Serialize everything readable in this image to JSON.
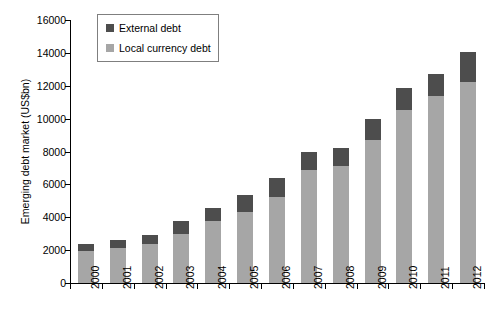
{
  "chart_data": {
    "type": "bar",
    "subtype": "stacked-vertical",
    "title": "",
    "xlabel": "",
    "ylabel": "Emerging debt market (US$bn)",
    "ylim": [
      0,
      16000
    ],
    "ytick_step": 2000,
    "ytick_labels": [
      "16000",
      "14000",
      "12000",
      "10000",
      "8000",
      "6000",
      "4000",
      "2000",
      "0"
    ],
    "ytick_values": [
      16000,
      14000,
      12000,
      10000,
      8000,
      6000,
      4000,
      2000,
      0
    ],
    "categories": [
      "2000",
      "2001",
      "2002",
      "2003",
      "2004",
      "2005",
      "2006",
      "2007",
      "2008",
      "2009",
      "2010",
      "2011",
      "2012"
    ],
    "grid": false,
    "legend_position": "top-left-inside",
    "series": [
      {
        "name": "Local currency debt",
        "color": "#a6a6a6",
        "values": [
          1950,
          2100,
          2350,
          3000,
          3750,
          4350,
          5250,
          6900,
          7100,
          8700,
          10500,
          11400,
          12200
        ]
      },
      {
        "name": "External debt",
        "color": "#4d4d4d",
        "values": [
          450,
          500,
          600,
          800,
          800,
          1000,
          1150,
          1100,
          1100,
          1300,
          1350,
          1300,
          1850
        ]
      }
    ],
    "totals": [
      2400,
      2600,
      2950,
      3800,
      4550,
      5350,
      6400,
      8000,
      8200,
      10000,
      11850,
      12700,
      14050
    ]
  },
  "legend": {
    "items": [
      {
        "label": "External debt",
        "color": "#4d4d4d",
        "swatch_name": "external-debt-swatch"
      },
      {
        "label": "Local currency debt",
        "color": "#a6a6a6",
        "swatch_name": "local-currency-debt-swatch"
      }
    ]
  },
  "colors": {
    "external_debt": "#4d4d4d",
    "local_currency_debt": "#a6a6a6",
    "axis": "#000000",
    "legend_border": "#7f7f7f",
    "background": "#ffffff"
  }
}
